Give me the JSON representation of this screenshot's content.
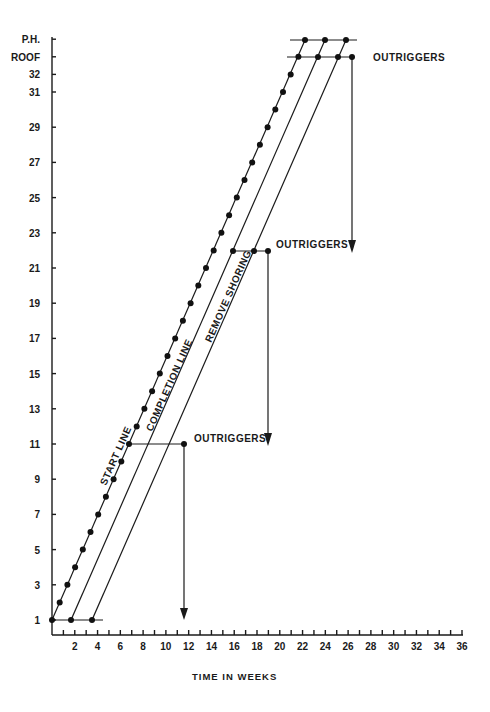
{
  "chart_data": {
    "type": "line",
    "title": "",
    "xlabel": "TIME IN WEEKS",
    "ylabel": "",
    "xlim": [
      0,
      36
    ],
    "x_ticks": [
      2,
      4,
      6,
      8,
      10,
      12,
      14,
      16,
      18,
      20,
      22,
      24,
      26,
      28,
      30,
      32,
      34,
      36
    ],
    "y_ticks": [
      "1",
      "3",
      "5",
      "7",
      "9",
      "11",
      "13",
      "15",
      "17",
      "19",
      "21",
      "23",
      "25",
      "27",
      "29",
      "31",
      "32",
      "ROOF",
      "P.H."
    ],
    "y_floor_values": [
      1,
      3,
      5,
      7,
      9,
      11,
      13,
      15,
      17,
      19,
      21,
      23,
      25,
      27,
      29,
      31,
      32,
      33,
      34
    ],
    "grid": false,
    "series": [
      {
        "name": "START LINE",
        "markers": "every floor",
        "points": [
          [
            0,
            1
          ],
          [
            21.6,
            33
          ],
          [
            22.2,
            34
          ]
        ]
      },
      {
        "name": "COMPLETION LINE",
        "points": [
          [
            1.7,
            1
          ],
          [
            23.3,
            33
          ],
          [
            24.0,
            34
          ]
        ]
      },
      {
        "name": "REMOVE SHORING",
        "points": [
          [
            3.5,
            1
          ],
          [
            25.1,
            33
          ],
          [
            25.8,
            34
          ]
        ]
      }
    ],
    "outrigger_events": [
      {
        "label": "OUTRIGGERS",
        "floor": 11,
        "from_week": 6.8,
        "to_week": 11.6,
        "drop_to_floor": 1
      },
      {
        "label": "OUTRIGGERS",
        "floor": 22,
        "from_week": 15.9,
        "to_week": 18.9,
        "drop_to_floor": 11
      },
      {
        "label": "OUTRIGGERS",
        "floor": 33,
        "from_week": 21.6,
        "to_week": 26.3,
        "drop_to_floor": 22
      }
    ],
    "annotations": [
      "START LINE",
      "COMPLETION LINE",
      "REMOVE SHORING",
      "OUTRIGGERS",
      "OUTRIGGERS",
      "OUTRIGGERS"
    ]
  },
  "labels": {
    "x_axis_title": "TIME IN WEEKS",
    "start_line": "START LINE",
    "completion_line": "COMPLETION LINE",
    "remove_shoring": "REMOVE SHORING",
    "outriggers_top": "OUTRIGGERS",
    "outriggers_mid": "OUTRIGGERS",
    "outriggers_low": "OUTRIGGERS"
  }
}
